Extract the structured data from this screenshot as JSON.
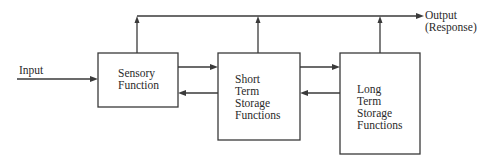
{
  "diagram": {
    "input_label": "Input",
    "output_label": [
      "Output",
      "(Response)"
    ],
    "boxes": [
      {
        "id": "sensory",
        "lines": [
          "Sensory",
          "Function"
        ]
      },
      {
        "id": "short-term",
        "lines": [
          "Short",
          "Term",
          "Storage",
          "Functions"
        ]
      },
      {
        "id": "long-term",
        "lines": [
          "Long",
          "Term",
          "Storage",
          "Functions"
        ]
      }
    ],
    "connections": [
      {
        "from": "input",
        "to": "sensory"
      },
      {
        "from": "sensory",
        "to": "short-term"
      },
      {
        "from": "short-term",
        "to": "sensory"
      },
      {
        "from": "short-term",
        "to": "long-term"
      },
      {
        "from": "long-term",
        "to": "short-term"
      },
      {
        "from": "sensory",
        "to": "output"
      },
      {
        "from": "short-term",
        "to": "output"
      },
      {
        "from": "long-term",
        "to": "output"
      }
    ]
  }
}
